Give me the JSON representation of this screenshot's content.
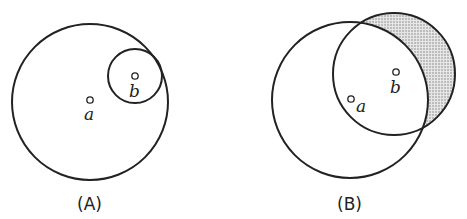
{
  "panels": [
    {
      "id": "A",
      "caption": "(A)",
      "description": "Circle b lies entirely inside circle a, internally tangent",
      "circles": [
        {
          "name": "circle-a",
          "cx": 90,
          "cy": 102,
          "r": 78
        },
        {
          "name": "circle-b",
          "cx": 135,
          "cy": 76,
          "r": 27
        }
      ],
      "points": [
        {
          "label": "a",
          "x": 90,
          "y": 100
        },
        {
          "label": "b",
          "x": 135,
          "y": 76
        }
      ]
    },
    {
      "id": "B",
      "caption": "(B)",
      "description": "Circle b partially overlaps circle a; part of b outside a is shaded",
      "circles": [
        {
          "name": "circle-a",
          "cx": 350,
          "cy": 100,
          "r": 78
        },
        {
          "name": "circle-b",
          "cx": 394,
          "cy": 74,
          "r": 61
        }
      ],
      "points": [
        {
          "label": "a",
          "x": 351,
          "y": 99
        },
        {
          "label": "b",
          "x": 396,
          "y": 72
        }
      ],
      "shaded_region": "b minus a",
      "shade_color": "#bdbdbd"
    }
  ]
}
